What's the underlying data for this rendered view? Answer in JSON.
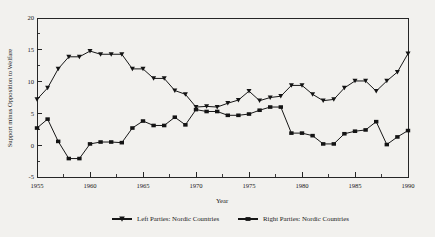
{
  "chart_data": {
    "type": "line",
    "title": "",
    "xlabel": "Year",
    "ylabel": "Support minus Opposition to Welfare",
    "xlim": [
      1955,
      1990
    ],
    "ylim": [
      -5,
      20
    ],
    "ytick_labels": [
      "20",
      "15",
      "10",
      "5",
      "0",
      "-5"
    ],
    "ytick_values": [
      20,
      15,
      10,
      5,
      0,
      -5
    ],
    "ytick_minor_values": [
      17.5,
      12.5,
      7.5,
      2.5,
      -2.5
    ],
    "xtick_labels": [
      "1955",
      "1960",
      "1965",
      "1970",
      "1975",
      "1980",
      "1985",
      "1990"
    ],
    "xtick_values": [
      1955,
      1960,
      1965,
      1970,
      1975,
      1980,
      1985,
      1990
    ],
    "xtick_minor_values": [
      1957.5,
      1962.5,
      1967.5,
      1972.5,
      1977.5,
      1982.5,
      1987.5
    ],
    "grid": false,
    "legend_position": "bottom-center",
    "x": [
      1955,
      1956,
      1957,
      1958,
      1959,
      1960,
      1961,
      1962,
      1963,
      1964,
      1965,
      1966,
      1967,
      1968,
      1969,
      1970,
      1971,
      1972,
      1973,
      1974,
      1975,
      1976,
      1977,
      1978,
      1979,
      1980,
      1981,
      1982,
      1983,
      1984,
      1985,
      1986,
      1987,
      1988,
      1989,
      1990
    ],
    "series": [
      {
        "name": "Left Parties: Nordic Countries",
        "marker": "triangle-down",
        "color": "#141414",
        "values": [
          7.2,
          9.0,
          12.0,
          13.9,
          13.9,
          14.8,
          14.3,
          14.3,
          14.3,
          12.0,
          12.0,
          10.5,
          10.5,
          8.6,
          8.0,
          6.0,
          6.1,
          6.0,
          6.6,
          7.1,
          8.5,
          7.0,
          7.5,
          7.7,
          9.4,
          9.4,
          8.0,
          7.0,
          7.2,
          9.0,
          10.1,
          10.1,
          8.5,
          10.1,
          11.5,
          14.4
        ]
      },
      {
        "name": "Right Parties: Nordic Countries",
        "marker": "square",
        "color": "#141414",
        "values": [
          2.7,
          4.1,
          0.6,
          -2.1,
          -2.1,
          0.2,
          0.5,
          0.5,
          0.4,
          2.7,
          3.8,
          3.1,
          3.1,
          4.4,
          3.2,
          5.6,
          5.3,
          5.3,
          4.7,
          4.7,
          4.9,
          5.5,
          6.0,
          6.0,
          1.9,
          1.9,
          1.5,
          0.2,
          0.2,
          1.8,
          2.2,
          2.4,
          3.7,
          0.1,
          1.3,
          2.3
        ]
      }
    ]
  },
  "legend": {
    "items": [
      {
        "label": "Left Parties: Nordic Countries",
        "marker": "triangle-down"
      },
      {
        "label": "Right Parties: Nordic Countries",
        "marker": "square"
      }
    ]
  },
  "axes": {
    "x_title": "Year",
    "y_title": "Support minus Opposition to Welfare"
  }
}
